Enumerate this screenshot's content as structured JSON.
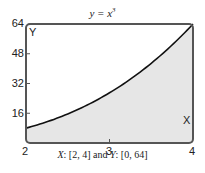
{
  "chart_data": {
    "type": "area",
    "title_base": "y = x",
    "title_exp": "3",
    "function": "y = x^3",
    "x": [
      2,
      2.25,
      2.5,
      2.75,
      3,
      3.25,
      3.5,
      3.75,
      4
    ],
    "values": [
      8,
      11.39,
      15.63,
      20.8,
      27,
      34.33,
      42.88,
      52.73,
      64
    ],
    "xlabel": "X",
    "ylabel": "Y",
    "xlim": [
      2,
      4
    ],
    "ylim": [
      0,
      64
    ],
    "x_ticks": [
      "2",
      "3",
      "4"
    ],
    "y_ticks": [
      "16",
      "32",
      "48",
      "64"
    ],
    "grid": false,
    "fill": "below curve",
    "caption": "X: [2, 4] and Y: [0, 64]",
    "colors": {
      "fill": "#e6e6e6",
      "curve": "#111111",
      "frame": "#555555"
    }
  },
  "caption": {
    "x_part": "X",
    "x_range": ": [2, 4] and ",
    "y_part": "Y",
    "y_range": ": [0, 64]"
  }
}
